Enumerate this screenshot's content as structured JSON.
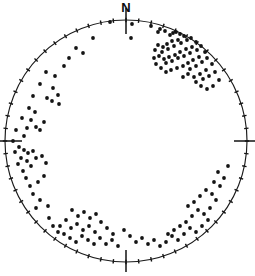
{
  "figure": {
    "title": "",
    "north_label": "N",
    "background_color": "#ffffff",
    "ink_color": "#141414"
  },
  "chart_data": {
    "type": "scatter",
    "title": "",
    "subtitle": "",
    "xlabel": "",
    "ylabel": "",
    "projection": "stereonet-equal-area-lower-hemisphere",
    "grid": false,
    "legend_position": "none",
    "annotations": [
      {
        "text": "N",
        "position": "top",
        "x": 126,
        "y": 12
      }
    ],
    "axis_labels": [
      "N"
    ],
    "tick_labels": [],
    "xlim": [
      5,
      247
    ],
    "ylim": [
      20,
      262
    ],
    "circle": {
      "cx": 126,
      "cy": 141,
      "r": 121
    },
    "cardinal_ticks": [
      {
        "name": "north-tick",
        "angle_deg": 0,
        "x1": 126,
        "y1": 8,
        "x2": 126,
        "y2": 34
      },
      {
        "name": "east-tick",
        "angle_deg": 90,
        "x1": 234,
        "y1": 141,
        "x2": 255,
        "y2": 141
      },
      {
        "name": "south-tick",
        "angle_deg": 180,
        "x1": 126,
        "y1": 250,
        "x2": 126,
        "y2": 272
      },
      {
        "name": "west-tick",
        "angle_deg": 270,
        "x1": 0,
        "y1": 141,
        "x2": 22,
        "y2": 141
      }
    ],
    "rim_tick_angles_deg": [
      0,
      6,
      12,
      18,
      24,
      30,
      36,
      42,
      48,
      54,
      60,
      66,
      72,
      78,
      84,
      90,
      96,
      102,
      108,
      114,
      120,
      126,
      132,
      138,
      144,
      150,
      156,
      162,
      168,
      174,
      180,
      186,
      192,
      198,
      204,
      210,
      216,
      222,
      228,
      234,
      240,
      246,
      252,
      258,
      264,
      270,
      276,
      282,
      288,
      294,
      300,
      306,
      312,
      318,
      324,
      330,
      336,
      342,
      348,
      354
    ],
    "point_radius_px": 1.9,
    "n_points": 171,
    "points": [
      [
        110,
        22
      ],
      [
        132,
        24
      ],
      [
        151,
        26
      ],
      [
        160,
        29
      ],
      [
        173,
        33
      ],
      [
        131,
        38
      ],
      [
        158,
        32
      ],
      [
        165,
        31
      ],
      [
        170,
        35
      ],
      [
        176,
        32
      ],
      [
        180,
        34
      ],
      [
        184,
        36
      ],
      [
        178,
        40
      ],
      [
        172,
        41
      ],
      [
        167,
        44
      ],
      [
        163,
        47
      ],
      [
        158,
        45
      ],
      [
        155,
        50
      ],
      [
        162,
        52
      ],
      [
        168,
        49
      ],
      [
        174,
        46
      ],
      [
        181,
        43
      ],
      [
        187,
        40
      ],
      [
        191,
        38
      ],
      [
        196,
        42
      ],
      [
        192,
        47
      ],
      [
        186,
        49
      ],
      [
        180,
        52
      ],
      [
        175,
        55
      ],
      [
        169,
        57
      ],
      [
        164,
        59
      ],
      [
        159,
        56
      ],
      [
        154,
        58
      ],
      [
        166,
        63
      ],
      [
        172,
        61
      ],
      [
        178,
        58
      ],
      [
        184,
        56
      ],
      [
        190,
        53
      ],
      [
        197,
        50
      ],
      [
        201,
        46
      ],
      [
        205,
        52
      ],
      [
        199,
        57
      ],
      [
        193,
        60
      ],
      [
        188,
        63
      ],
      [
        183,
        66
      ],
      [
        177,
        68
      ],
      [
        171,
        70
      ],
      [
        166,
        72
      ],
      [
        161,
        68
      ],
      [
        156,
        64
      ],
      [
        190,
        69
      ],
      [
        196,
        66
      ],
      [
        202,
        62
      ],
      [
        207,
        58
      ],
      [
        212,
        64
      ],
      [
        206,
        70
      ],
      [
        200,
        74
      ],
      [
        194,
        77
      ],
      [
        188,
        74
      ],
      [
        183,
        77
      ],
      [
        196,
        82
      ],
      [
        203,
        79
      ],
      [
        209,
        76
      ],
      [
        215,
        72
      ],
      [
        219,
        80
      ],
      [
        213,
        86
      ],
      [
        207,
        89
      ],
      [
        201,
        86
      ],
      [
        88,
        22
      ],
      [
        72,
        28
      ],
      [
        60,
        34
      ],
      [
        48,
        44
      ],
      [
        38,
        55
      ],
      [
        93,
        38
      ],
      [
        76,
        48
      ],
      [
        83,
        53
      ],
      [
        69,
        58
      ],
      [
        64,
        66
      ],
      [
        55,
        76
      ],
      [
        46,
        72
      ],
      [
        40,
        84
      ],
      [
        33,
        96
      ],
      [
        29,
        108
      ],
      [
        53,
        88
      ],
      [
        58,
        95
      ],
      [
        52,
        101
      ],
      [
        47,
        98
      ],
      [
        59,
        104
      ],
      [
        35,
        112
      ],
      [
        31,
        120
      ],
      [
        27,
        128
      ],
      [
        24,
        136
      ],
      [
        22,
        118
      ],
      [
        40,
        130
      ],
      [
        44,
        122
      ],
      [
        36,
        127
      ],
      [
        16,
        130
      ],
      [
        13,
        141
      ],
      [
        15,
        152
      ],
      [
        19,
        147
      ],
      [
        21,
        158
      ],
      [
        24,
        150
      ],
      [
        28,
        153
      ],
      [
        33,
        151
      ],
      [
        27,
        161
      ],
      [
        31,
        166
      ],
      [
        18,
        164
      ],
      [
        23,
        171
      ],
      [
        36,
        158
      ],
      [
        42,
        156
      ],
      [
        46,
        163
      ],
      [
        26,
        178
      ],
      [
        30,
        186
      ],
      [
        38,
        182
      ],
      [
        44,
        176
      ],
      [
        33,
        194
      ],
      [
        40,
        200
      ],
      [
        48,
        206
      ],
      [
        36,
        208
      ],
      [
        72,
        210
      ],
      [
        78,
        216
      ],
      [
        84,
        212
      ],
      [
        90,
        218
      ],
      [
        96,
        214
      ],
      [
        66,
        220
      ],
      [
        60,
        226
      ],
      [
        71,
        228
      ],
      [
        77,
        224
      ],
      [
        83,
        230
      ],
      [
        89,
        226
      ],
      [
        95,
        232
      ],
      [
        101,
        222
      ],
      [
        107,
        228
      ],
      [
        113,
        234
      ],
      [
        64,
        234
      ],
      [
        70,
        238
      ],
      [
        76,
        242
      ],
      [
        82,
        236
      ],
      [
        88,
        240
      ],
      [
        94,
        244
      ],
      [
        100,
        238
      ],
      [
        106,
        244
      ],
      [
        112,
        240
      ],
      [
        118,
        246
      ],
      [
        58,
        232
      ],
      [
        53,
        226
      ],
      [
        49,
        218
      ],
      [
        124,
        230
      ],
      [
        130,
        236
      ],
      [
        136,
        242
      ],
      [
        142,
        238
      ],
      [
        148,
        244
      ],
      [
        154,
        240
      ],
      [
        160,
        246
      ],
      [
        166,
        242
      ],
      [
        172,
        236
      ],
      [
        178,
        240
      ],
      [
        184,
        234
      ],
      [
        190,
        228
      ],
      [
        196,
        232
      ],
      [
        202,
        226
      ],
      [
        208,
        220
      ],
      [
        186,
        222
      ],
      [
        180,
        226
      ],
      [
        174,
        230
      ],
      [
        168,
        234
      ],
      [
        192,
        216
      ],
      [
        198,
        210
      ],
      [
        204,
        214
      ],
      [
        210,
        208
      ],
      [
        188,
        206
      ],
      [
        194,
        202
      ],
      [
        200,
        196
      ],
      [
        206,
        190
      ],
      [
        216,
        200
      ],
      [
        212,
        194
      ],
      [
        220,
        186
      ],
      [
        224,
        178
      ],
      [
        214,
        182
      ],
      [
        218,
        172
      ],
      [
        228,
        166
      ]
    ]
  }
}
